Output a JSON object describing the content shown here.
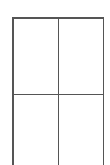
{
  "figure": {
    "name": "two-by-two-grid-outline",
    "type": "table-grid",
    "background_color": "#ffffff",
    "line_color": "#555555",
    "line_width_px": 1.5,
    "columns": 2,
    "rows": 2,
    "bottom_edge_cropped": true,
    "cells": [
      {
        "row": 0,
        "col": 0,
        "text": ""
      },
      {
        "row": 0,
        "col": 1,
        "text": ""
      },
      {
        "row": 1,
        "col": 0,
        "text": ""
      },
      {
        "row": 1,
        "col": 1,
        "text": ""
      }
    ],
    "rules": {
      "top_label": "top-border",
      "left_label": "left-border",
      "right_label": "right-border",
      "column_divider_label": "column-divider",
      "row_divider_label": "row-divider"
    }
  }
}
